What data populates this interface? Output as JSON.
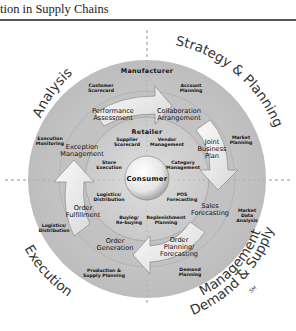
{
  "header": {
    "title": "tion in Supply Chains"
  },
  "diagram": {
    "quadrants": [
      {
        "id": "analysis",
        "label": "Analysis"
      },
      {
        "id": "strategy",
        "label": "Strategy & Planning"
      },
      {
        "id": "execution",
        "label": "Execution"
      },
      {
        "id": "demand-supply",
        "label": "Demand & Supply",
        "label2": "Management",
        "mark": "SM"
      }
    ],
    "rings": {
      "outer": "Manufacturer",
      "middle": "Retailer",
      "center": "Consumer"
    },
    "outer_ring_items": [
      {
        "text": "Customer",
        "text2": "Scorecard"
      },
      {
        "text": "Account",
        "text2": "Planning"
      },
      {
        "text": "Market",
        "text2": "Planning"
      },
      {
        "text": "Market",
        "text2": "Data",
        "text3": "Analysis"
      },
      {
        "text": "Demand",
        "text2": "Planning"
      },
      {
        "text": "Production &",
        "text2": "Supply Planning"
      },
      {
        "text": "Logistics/",
        "text2": "Distribution"
      },
      {
        "text": "Execution",
        "text2": "Monitoring"
      }
    ],
    "cycle_steps": [
      {
        "text": "Performance",
        "text2": "Assessment"
      },
      {
        "text": "Collaboration",
        "text2": "Arrangement"
      },
      {
        "text": "Joint",
        "text2": "Business",
        "text3": "Plan"
      },
      {
        "text": "Sales",
        "text2": "Forecasting"
      },
      {
        "text": "Order",
        "text2": "Planning/",
        "text3": "Forecasting"
      },
      {
        "text": "Order",
        "text2": "Generation"
      },
      {
        "text": "Order",
        "text2": "Fulfillment"
      },
      {
        "text": "Exception",
        "text2": "Management"
      }
    ],
    "inner_ring_items": [
      {
        "text": "Supplier",
        "text2": "Scorecard"
      },
      {
        "text": "Vendor",
        "text2": "Management"
      },
      {
        "text": "Category",
        "text2": "Management"
      },
      {
        "text": "POS",
        "text2": "Forecasting"
      },
      {
        "text": "Replenishment",
        "text2": "Planning"
      },
      {
        "text": "Buying/",
        "text2": "Re-buying"
      },
      {
        "text": "Logistics/",
        "text2": "Distribution"
      },
      {
        "text": "Store",
        "text2": "Execution"
      }
    ]
  }
}
